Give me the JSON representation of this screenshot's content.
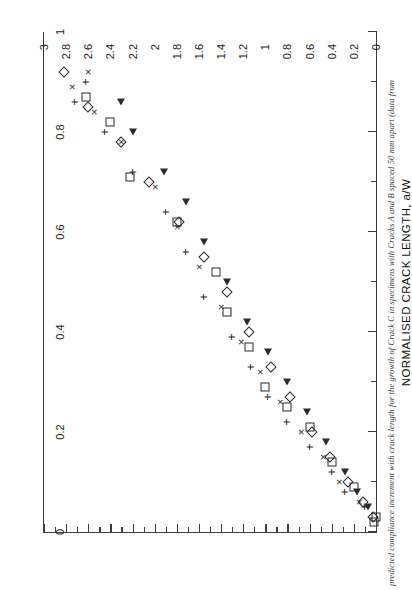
{
  "page": {
    "orientation": "rotated-90",
    "caption": "predicted compliance increment with crack length for the growth of Crack C in specimens with Cracks A and B spaced 50 mm apart (data from"
  },
  "chart_data": {
    "type": "scatter",
    "title": "",
    "xlabel": "NORMALISED CRACK LENGTH, a/W",
    "ylabel": "",
    "xlim": [
      0,
      1
    ],
    "ylim": [
      0,
      3
    ],
    "grid": false,
    "legend": "none",
    "x_ticks": [
      0,
      0.1,
      0.2,
      0.3,
      0.4,
      0.5,
      0.6,
      0.7,
      0.8,
      0.9,
      1
    ],
    "x_tick_labels": [
      "0",
      "",
      "0.2",
      "",
      "0.4",
      "",
      "0.6",
      "",
      "0.8",
      "",
      "1"
    ],
    "y_ticks": [
      0,
      0.1,
      0.2,
      0.3,
      0.4,
      0.5,
      0.6,
      0.7,
      0.8,
      0.9,
      1,
      1.1,
      1.2,
      1.3,
      1.4,
      1.5,
      1.6,
      1.7,
      1.8,
      1.9,
      2,
      2.1,
      2.2,
      2.3,
      2.4,
      2.5,
      2.6,
      2.7,
      2.8,
      2.9,
      3
    ],
    "y_tick_labels": [
      "0",
      "",
      "0.2",
      "",
      "0.4",
      "",
      "0.6",
      "",
      "0.8",
      "",
      "1",
      "",
      "1.2",
      "",
      "1.4",
      "",
      "1.6",
      "",
      "1.8",
      "",
      "2",
      "",
      "2.2",
      "",
      "2.4",
      "",
      "2.6",
      "",
      "2.8",
      "",
      "3"
    ],
    "series": [
      {
        "name": "series-square",
        "marker": "square",
        "points": [
          [
            0.02,
            0.02
          ],
          [
            0.03,
            0.0
          ],
          [
            0.09,
            0.2
          ],
          [
            0.14,
            0.4
          ],
          [
            0.21,
            0.6
          ],
          [
            0.25,
            0.8
          ],
          [
            0.29,
            1.0
          ],
          [
            0.37,
            1.15
          ],
          [
            0.44,
            1.35
          ],
          [
            0.52,
            1.45
          ],
          [
            0.62,
            1.8
          ],
          [
            0.71,
            2.22
          ],
          [
            0.82,
            2.4
          ],
          [
            0.87,
            2.62
          ]
        ]
      },
      {
        "name": "series-plus",
        "marker": "plus",
        "points": [
          [
            0.05,
            0.1
          ],
          [
            0.08,
            0.28
          ],
          [
            0.12,
            0.4
          ],
          [
            0.17,
            0.6
          ],
          [
            0.22,
            0.8
          ],
          [
            0.27,
            0.98
          ],
          [
            0.33,
            1.13
          ],
          [
            0.39,
            1.3
          ],
          [
            0.47,
            1.55
          ],
          [
            0.56,
            1.72
          ],
          [
            0.64,
            1.9
          ],
          [
            0.72,
            2.2
          ],
          [
            0.8,
            2.45
          ],
          [
            0.86,
            2.72
          ],
          [
            0.9,
            2.62
          ]
        ]
      },
      {
        "name": "series-ex",
        "marker": "ex",
        "points": [
          [
            0.06,
            0.15
          ],
          [
            0.1,
            0.33
          ],
          [
            0.15,
            0.48
          ],
          [
            0.2,
            0.68
          ],
          [
            0.26,
            0.87
          ],
          [
            0.32,
            1.05
          ],
          [
            0.38,
            1.22
          ],
          [
            0.45,
            1.4
          ],
          [
            0.53,
            1.6
          ],
          [
            0.61,
            1.8
          ],
          [
            0.69,
            2.0
          ],
          [
            0.78,
            2.3
          ],
          [
            0.84,
            2.55
          ],
          [
            0.89,
            2.75
          ],
          [
            0.92,
            2.6
          ]
        ]
      },
      {
        "name": "series-triangle",
        "marker": "triangle",
        "points": [
          [
            0.05,
            0.07
          ],
          [
            0.08,
            0.17
          ],
          [
            0.12,
            0.28
          ],
          [
            0.18,
            0.45
          ],
          [
            0.24,
            0.62
          ],
          [
            0.3,
            0.8
          ],
          [
            0.36,
            0.98
          ],
          [
            0.42,
            1.17
          ],
          [
            0.5,
            1.35
          ],
          [
            0.58,
            1.55
          ],
          [
            0.66,
            1.72
          ],
          [
            0.72,
            1.92
          ],
          [
            0.8,
            2.2
          ],
          [
            0.86,
            2.3
          ]
        ]
      },
      {
        "name": "series-diamond",
        "marker": "diamond",
        "points": [
          [
            0.03,
            0.03
          ],
          [
            0.06,
            0.12
          ],
          [
            0.1,
            0.25
          ],
          [
            0.15,
            0.42
          ],
          [
            0.2,
            0.58
          ],
          [
            0.27,
            0.78
          ],
          [
            0.33,
            0.95
          ],
          [
            0.4,
            1.15
          ],
          [
            0.48,
            1.35
          ],
          [
            0.55,
            1.55
          ],
          [
            0.62,
            1.78
          ],
          [
            0.7,
            2.05
          ],
          [
            0.78,
            2.3
          ],
          [
            0.85,
            2.6
          ],
          [
            0.92,
            2.82
          ]
        ]
      }
    ]
  }
}
